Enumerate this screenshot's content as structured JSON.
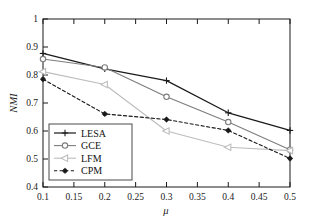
{
  "figure": {
    "background": "#ffffff",
    "frame_color": "#1a1a1a"
  },
  "chart_data": {
    "type": "line",
    "title": "",
    "xlabel": "μ",
    "ylabel": "NMI",
    "x": [
      0.1,
      0.2,
      0.3,
      0.4,
      0.5
    ],
    "xlim": [
      0.1,
      0.5
    ],
    "ylim": [
      0.4,
      1.0
    ],
    "xticks": [
      0.1,
      0.15,
      0.2,
      0.25,
      0.3,
      0.35,
      0.4,
      0.45,
      0.5
    ],
    "xticklabels": [
      "0.1",
      "0.15",
      "0.2",
      "0.25",
      "0.3",
      "0.35",
      "0.4",
      "0.45",
      "0.5"
    ],
    "yticks": [
      0.4,
      0.5,
      0.6,
      0.7,
      0.8,
      0.9,
      1.0
    ],
    "yticklabels": [
      "0.4",
      "0.5",
      "0.6",
      "0.7",
      "0.8",
      "0.9",
      "1"
    ],
    "grid": false,
    "legend_position": "lower left",
    "series": [
      {
        "name": "LESA",
        "values": [
          0.877,
          0.822,
          0.78,
          0.665,
          0.602
        ],
        "color": "#1a1a1a",
        "linestyle": "solid",
        "marker": "plus",
        "linewidth": 1.2
      },
      {
        "name": "GCE",
        "values": [
          0.857,
          0.827,
          0.722,
          0.632,
          0.533
        ],
        "color": "#7d7d7d",
        "linestyle": "solid",
        "marker": "circle",
        "linewidth": 1.1
      },
      {
        "name": "LFM",
        "values": [
          0.812,
          0.766,
          0.6,
          0.542,
          0.53
        ],
        "color": "#bdbdbd",
        "linestyle": "solid",
        "marker": "triangle-left",
        "linewidth": 1.1
      },
      {
        "name": "CPM",
        "values": [
          0.785,
          0.661,
          0.641,
          0.602,
          0.502
        ],
        "color": "#1a1a1a",
        "linestyle": "dashed",
        "marker": "star-filled",
        "linewidth": 1.1
      }
    ]
  },
  "legend": {
    "entries": [
      {
        "label": "LESA"
      },
      {
        "label": "GCE"
      },
      {
        "label": "LFM"
      },
      {
        "label": "CPM"
      }
    ]
  }
}
